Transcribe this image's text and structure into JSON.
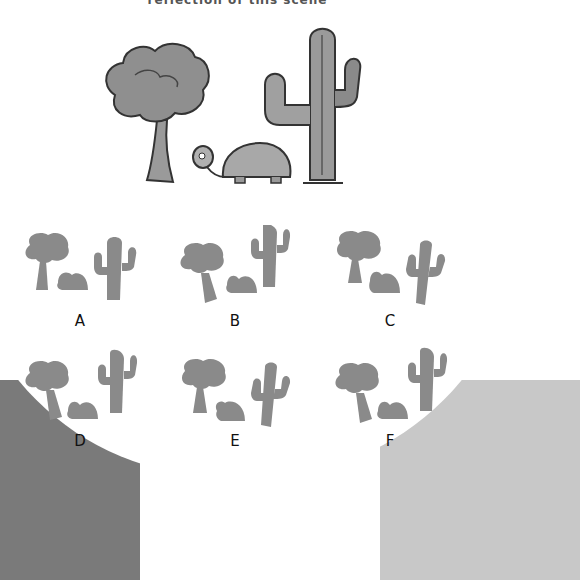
{
  "prompt": "reflection of this scene",
  "scene": {
    "elements": [
      "tree-icon",
      "turtle-icon",
      "cactus-icon"
    ],
    "colors": {
      "foliage": "#8f8f8f",
      "outline": "#3a3a3a",
      "silhouette": "#8a8a8a"
    }
  },
  "options": [
    {
      "label": "A",
      "mirrored": false,
      "variant": "a"
    },
    {
      "label": "B",
      "mirrored": false,
      "variant": "b"
    },
    {
      "label": "C",
      "mirrored": false,
      "variant": "c"
    },
    {
      "label": "D",
      "mirrored": false,
      "variant": "d"
    },
    {
      "label": "E",
      "mirrored": false,
      "variant": "e"
    },
    {
      "label": "F",
      "mirrored": false,
      "variant": "f"
    }
  ]
}
